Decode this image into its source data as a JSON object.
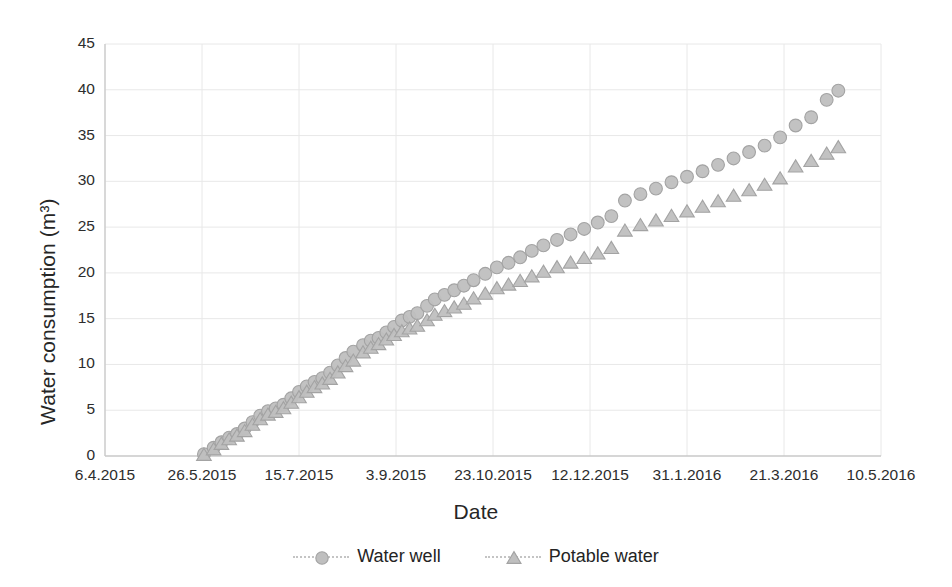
{
  "chart_data": {
    "type": "scatter",
    "title": "",
    "xlabel": "Date",
    "ylabel": "Water consumption (m³)",
    "grid": true,
    "legend_position": "bottom",
    "ylim": [
      0,
      45
    ],
    "yticks": [
      0,
      5,
      10,
      15,
      20,
      25,
      30,
      35,
      40,
      45
    ],
    "xticks": [
      "6.4.2015",
      "26.5.2015",
      "15.7.2015",
      "3.9.2015",
      "23.10.2015",
      "12.12.2015",
      "31.1.2016",
      "21.3.2016",
      "10.5.2016"
    ],
    "xtick_days": [
      0,
      50,
      100,
      150,
      200,
      250,
      300,
      350,
      400
    ],
    "xlim_days": [
      0,
      400
    ],
    "marker_fill": "#bfbfbf",
    "marker_stroke": "#a6a6a6",
    "gridline_color": "#e8e8e8",
    "axis_color": "#d9d9d9",
    "series": [
      {
        "name": "Water well",
        "marker": "circle",
        "color": "#bfbfbf",
        "x_days": [
          51,
          56,
          60,
          64,
          68,
          72,
          76,
          80,
          84,
          88,
          92,
          96,
          100,
          104,
          108,
          112,
          116,
          120,
          124,
          128,
          133,
          137,
          141,
          145,
          149,
          153,
          157,
          161,
          166,
          170,
          175,
          180,
          185,
          190,
          196,
          202,
          208,
          214,
          220,
          226,
          233,
          240,
          247,
          254,
          261,
          268,
          276,
          284,
          292,
          300,
          308,
          316,
          324,
          332,
          340,
          348,
          356,
          364,
          372,
          378
        ],
        "values": [
          0.2,
          0.9,
          1.5,
          2.0,
          2.4,
          3.0,
          3.7,
          4.4,
          4.9,
          5.2,
          5.6,
          6.3,
          7.0,
          7.6,
          8.1,
          8.5,
          9.1,
          9.9,
          10.7,
          11.4,
          12.1,
          12.6,
          12.9,
          13.5,
          14.1,
          14.8,
          15.2,
          15.6,
          16.4,
          17.1,
          17.6,
          18.1,
          18.6,
          19.2,
          19.9,
          20.6,
          21.1,
          21.7,
          22.4,
          23.0,
          23.6,
          24.2,
          24.8,
          25.5,
          26.2,
          27.9,
          28.6,
          29.2,
          29.9,
          30.5,
          31.1,
          31.8,
          32.5,
          33.2,
          33.9,
          34.8,
          36.1,
          37.0,
          38.9,
          39.9
        ]
      },
      {
        "name": "Potable water",
        "marker": "triangle",
        "color": "#bfbfbf",
        "x_days": [
          51,
          56,
          60,
          64,
          68,
          72,
          76,
          80,
          84,
          88,
          92,
          96,
          100,
          104,
          108,
          112,
          116,
          120,
          124,
          128,
          133,
          137,
          141,
          145,
          149,
          153,
          157,
          161,
          166,
          170,
          175,
          180,
          185,
          190,
          196,
          202,
          208,
          214,
          220,
          226,
          233,
          240,
          247,
          254,
          261,
          268,
          276,
          284,
          292,
          300,
          308,
          316,
          324,
          332,
          340,
          348,
          356,
          364,
          372,
          378
        ],
        "values": [
          0.1,
          0.7,
          1.3,
          1.8,
          2.2,
          2.7,
          3.4,
          4.0,
          4.5,
          4.8,
          5.2,
          5.8,
          6.4,
          7.0,
          7.5,
          7.9,
          8.4,
          9.1,
          9.8,
          10.4,
          11.3,
          11.8,
          12.2,
          12.7,
          13.2,
          13.6,
          13.9,
          14.2,
          14.8,
          15.4,
          15.8,
          16.2,
          16.6,
          17.2,
          17.7,
          18.3,
          18.7,
          19.1,
          19.6,
          20.1,
          20.6,
          21.1,
          21.6,
          22.1,
          22.7,
          24.6,
          25.2,
          25.7,
          26.2,
          26.7,
          27.2,
          27.8,
          28.4,
          29.0,
          29.6,
          30.3,
          31.6,
          32.2,
          33.0,
          33.7
        ]
      }
    ]
  },
  "legend": {
    "items": [
      {
        "label": "Water well",
        "marker": "circle"
      },
      {
        "label": "Potable water",
        "marker": "triangle"
      }
    ]
  }
}
